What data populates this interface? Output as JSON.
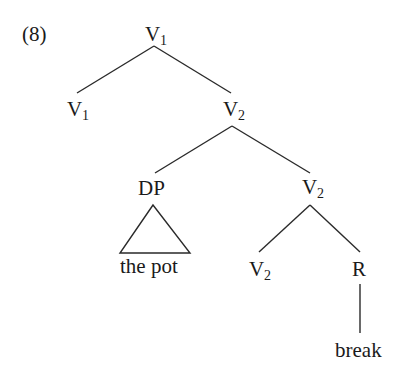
{
  "example_number": "(8)",
  "tree": {
    "root": {
      "label": "V",
      "sub": "1"
    },
    "left_child": {
      "label": "V",
      "sub": "1"
    },
    "mid": {
      "label": "V",
      "sub": "2"
    },
    "dp": {
      "label": "DP",
      "text": "the pot"
    },
    "v2_right": {
      "label": "V",
      "sub": "2"
    },
    "v2_bottom": {
      "label": "V",
      "sub": "2"
    },
    "r": {
      "label": "R",
      "text": "break"
    }
  }
}
